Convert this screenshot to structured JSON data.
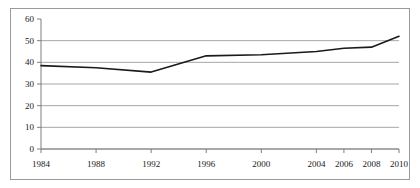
{
  "chart_data": {
    "type": "line",
    "title": "",
    "subtitle": "",
    "xlabel": "",
    "ylabel": "",
    "grid": true,
    "legend": false,
    "legend_position": "none",
    "line_color": "#1a1a1a",
    "grid_color": "#a6a6a6",
    "axis_color": "#7f7f7f",
    "border_color": "#9a9a9a",
    "background_color": "#ffffff",
    "categories": [
      "1984",
      "1988",
      "1992",
      "1996",
      "2000",
      "2004",
      "2006",
      "2008",
      "2010"
    ],
    "x": [
      1984,
      1988,
      1992,
      1996,
      2000,
      2004,
      2006,
      2008,
      2010
    ],
    "values": [
      38.5,
      37.5,
      35.5,
      43.0,
      43.5,
      45.0,
      46.5,
      47.0,
      52.0
    ],
    "series": [
      {
        "name": "",
        "values": [
          38.5,
          37.5,
          35.5,
          43.0,
          43.5,
          45.0,
          46.5,
          47.0,
          52.0
        ]
      }
    ],
    "xlim": [
      1984,
      2010
    ],
    "ylim": [
      0,
      60
    ],
    "y_ticks": [
      0,
      10,
      20,
      30,
      40,
      50,
      60
    ],
    "y_tick_labels": [
      "0",
      "10",
      "20",
      "30",
      "40",
      "50",
      "60"
    ],
    "x_tick_labels": [
      "1984",
      "1988",
      "1992",
      "1996",
      "2000",
      "2004",
      "2006",
      "2008",
      "2010"
    ]
  }
}
